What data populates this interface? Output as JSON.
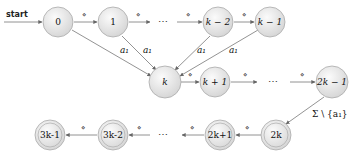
{
  "diagram": {
    "type": "automaton",
    "start_label": "start",
    "rows": {
      "top": [
        {
          "id": "q0",
          "label": "0",
          "accepting": false
        },
        {
          "id": "q1",
          "label": "1",
          "accepting": false
        },
        {
          "id": "dots1",
          "label": "⋯"
        },
        {
          "id": "qk2",
          "label": "k − 2",
          "accepting": false
        },
        {
          "id": "qk1",
          "label": "k − 1",
          "accepting": false
        }
      ],
      "middle": [
        {
          "id": "qk",
          "label": "k",
          "accepting": false
        },
        {
          "id": "qkp1",
          "label": "k + 1",
          "accepting": false
        },
        {
          "id": "dots2",
          "label": "⋯"
        },
        {
          "id": "q2k1",
          "label": "2k − 1",
          "accepting": false
        }
      ],
      "bottom": [
        {
          "id": "q3k1",
          "label": "3k-1",
          "accepting": true
        },
        {
          "id": "q3k2",
          "label": "3k-2",
          "accepting": true
        },
        {
          "id": "dots3",
          "label": "⋯"
        },
        {
          "id": "q2kp1",
          "label": "2k+1",
          "accepting": true
        },
        {
          "id": "q2k",
          "label": "2k",
          "accepting": true
        }
      ]
    },
    "edge_labels": {
      "diamond": "⋄",
      "a1": "a₁",
      "sigma_minus": "Σ \\ {a₁}"
    },
    "edges": [
      {
        "from": "start",
        "to": "q0",
        "label": ""
      },
      {
        "from": "q0",
        "to": "q1",
        "label": "⋄"
      },
      {
        "from": "q1",
        "to": "dots1",
        "label": "⋄"
      },
      {
        "from": "dots1",
        "to": "qk2",
        "label": "⋄"
      },
      {
        "from": "qk2",
        "to": "qk1",
        "label": "⋄"
      },
      {
        "from": "q0",
        "to": "qk",
        "label": "a₁"
      },
      {
        "from": "q1",
        "to": "qk",
        "label": "a₁"
      },
      {
        "from": "qk2",
        "to": "qk",
        "label": "a₁"
      },
      {
        "from": "qk1",
        "to": "qk",
        "label": "a₁"
      },
      {
        "from": "qk",
        "to": "qkp1",
        "label": "⋄"
      },
      {
        "from": "qkp1",
        "to": "dots2",
        "label": "⋄"
      },
      {
        "from": "dots2",
        "to": "q2k1",
        "label": "⋄"
      },
      {
        "from": "q2k1",
        "to": "q2k",
        "label": "Σ \\ {a₁}"
      },
      {
        "from": "q2k",
        "to": "q2kp1",
        "label": "⋄"
      },
      {
        "from": "q2kp1",
        "to": "dots3",
        "label": "⋄"
      },
      {
        "from": "dots3",
        "to": "q3k2",
        "label": "⋄"
      },
      {
        "from": "q3k2",
        "to": "q3k1",
        "label": "⋄"
      }
    ]
  }
}
